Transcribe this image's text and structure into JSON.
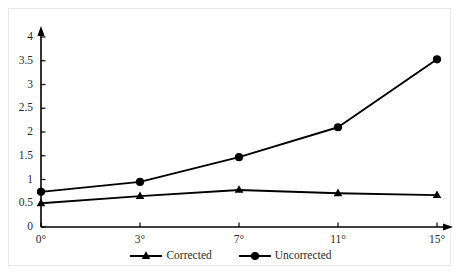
{
  "chart_data": {
    "type": "line",
    "title": "",
    "subtitle": "",
    "xlabel": "",
    "ylabel": "",
    "categories": [
      "0°",
      "3°",
      "7°",
      "11°",
      "15°"
    ],
    "x": [
      0,
      3,
      7,
      11,
      15
    ],
    "series": [
      {
        "name": "Corrected",
        "marker": "triangle",
        "color": "#000000",
        "values": [
          0.5,
          0.65,
          0.78,
          0.71,
          0.67
        ]
      },
      {
        "name": "Uncorrected",
        "marker": "circle",
        "color": "#000000",
        "values": [
          0.74,
          0.95,
          1.47,
          2.1,
          3.53
        ]
      }
    ],
    "ylim": [
      0,
      4
    ],
    "yticks": [
      0,
      0.5,
      1,
      1.5,
      2,
      2.5,
      3,
      3.5,
      4
    ],
    "ytick_labels": [
      "0",
      "0.5",
      "1",
      "1.5",
      "2",
      "2.5",
      "3",
      "3.5",
      "4"
    ],
    "xtick_labels": [
      "0°",
      "3°",
      "7°",
      "11°",
      "15°"
    ],
    "grid": false,
    "legend_position": "bottom",
    "axis_arrows": true,
    "axis_color": "#000000",
    "frame_color": "#e9e9ea",
    "background": "#ffffff"
  },
  "legend": {
    "entries": [
      {
        "label": "Corrected"
      },
      {
        "label": "Uncorrected"
      }
    ]
  }
}
